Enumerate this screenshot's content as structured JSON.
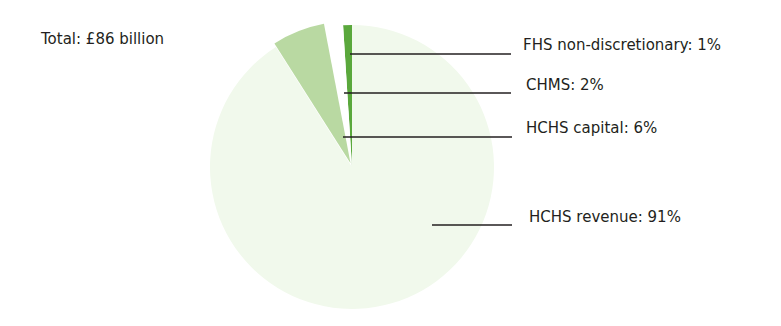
{
  "chart_data": {
    "type": "pie",
    "title": "Total: £86 billion",
    "total": "£86 billion",
    "categories": [
      "FHS non-discretionary",
      "CHMS",
      "HCHS capital",
      "HCHS revenue"
    ],
    "values": [
      1,
      2,
      6,
      91
    ],
    "unit": "%",
    "colors": [
      "#5aa83c",
      "#ffffff",
      "#b9d9a2",
      "#f1f9ec"
    ],
    "labels": [
      "FHS non-discretionary: 1%",
      "CHMS: 2%",
      "HCHS capital: 6%",
      "HCHS revenue: 91%"
    ],
    "legend": "leader-line labels to the right of the pie",
    "exploded": [
      "HCHS capital"
    ]
  },
  "header": {
    "total_label": "Total: £86 billion"
  }
}
